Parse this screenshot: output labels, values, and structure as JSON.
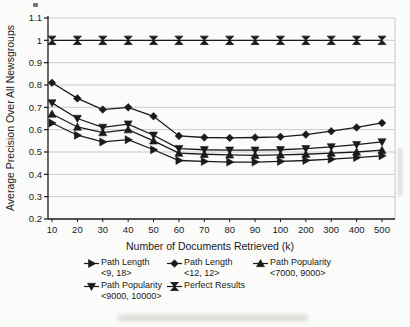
{
  "chart_data": {
    "type": "line",
    "title": "",
    "xlabel": "Number of Documents Retrieved (k)",
    "ylabel": "Average Precision Over All Newsgroups",
    "categories": [
      "10",
      "20",
      "30",
      "40",
      "50",
      "60",
      "70",
      "80",
      "90",
      "100",
      "200",
      "300",
      "400",
      "500"
    ],
    "ylim": [
      0.2,
      1.1
    ],
    "ytick_step": 0.1,
    "ytick_labels": [
      "0.2",
      "0.3",
      "0.4",
      "0.5",
      "0.6",
      "0.7",
      "0.8",
      "0.9",
      "1",
      "1.1"
    ],
    "grid": "horizontal",
    "legend_position": "bottom",
    "line_color": "#1a1a1a",
    "grid_color": "#c9c9c9",
    "series": [
      {
        "name": "Path Length <9, 18>",
        "marker": "triangle-right",
        "values": [
          0.63,
          0.575,
          0.545,
          0.555,
          0.51,
          0.462,
          0.458,
          0.455,
          0.455,
          0.458,
          0.462,
          0.468,
          0.475,
          0.483
        ]
      },
      {
        "name": "Path Length <12, 12>",
        "marker": "diamond",
        "values": [
          0.81,
          0.74,
          0.69,
          0.7,
          0.66,
          0.572,
          0.565,
          0.563,
          0.565,
          0.568,
          0.578,
          0.593,
          0.61,
          0.63
        ]
      },
      {
        "name": "Path Popularity <7000, 9000>",
        "marker": "triangle-up",
        "values": [
          0.67,
          0.612,
          0.587,
          0.6,
          0.55,
          0.495,
          0.49,
          0.487,
          0.485,
          0.487,
          0.49,
          0.495,
          0.5,
          0.508
        ]
      },
      {
        "name": "Path Popularity <9000, 10000>",
        "marker": "triangle-down",
        "values": [
          0.72,
          0.65,
          0.61,
          0.625,
          0.575,
          0.515,
          0.51,
          0.508,
          0.508,
          0.51,
          0.515,
          0.523,
          0.533,
          0.545
        ]
      },
      {
        "name": "Perfect Results",
        "marker": "bowtie",
        "values": [
          1.0,
          1.0,
          1.0,
          1.0,
          1.0,
          1.0,
          1.0,
          1.0,
          1.0,
          1.0,
          1.0,
          1.0,
          1.0,
          1.0
        ]
      }
    ]
  },
  "legend": {
    "items": [
      {
        "label": "Path Length",
        "sublabel": "<9, 18>",
        "marker": "triangle-right"
      },
      {
        "label": "Path Length",
        "sublabel": "<12, 12>",
        "marker": "diamond"
      },
      {
        "label": "Path Popularity",
        "sublabel": "<7000, 9000>",
        "marker": "triangle-up"
      },
      {
        "label": "Path Popularity",
        "sublabel": "<9000, 10000>",
        "marker": "triangle-down"
      },
      {
        "label": "Perfect Results",
        "sublabel": "",
        "marker": "bowtie"
      }
    ]
  }
}
